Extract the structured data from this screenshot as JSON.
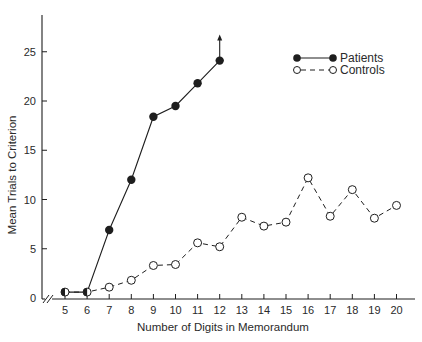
{
  "chart_data": {
    "type": "line",
    "title": "",
    "xlabel": "Number of Digits in Memorandum",
    "ylabel": "Mean Trials to Criterion",
    "x_ticks": [
      5,
      6,
      7,
      8,
      9,
      10,
      11,
      12,
      13,
      14,
      15,
      16,
      17,
      18,
      19,
      20
    ],
    "y_ticks": [
      0,
      5,
      10,
      15,
      20,
      25
    ],
    "ylim": [
      0,
      28
    ],
    "xlim": [
      4,
      20.8
    ],
    "axis_break": "x-axis broken between 0 and 5",
    "grid": false,
    "legend_position": "top-right",
    "series": [
      {
        "name": "Patients",
        "marker": "filled-circle",
        "line_style": "solid",
        "x": [
          5,
          6,
          7,
          8,
          9,
          10,
          11,
          12
        ],
        "y": [
          0.6,
          0.6,
          6.9,
          12.0,
          18.4,
          19.5,
          21.8,
          24.1
        ],
        "annotation": "upward arrow at x=12 (exceeds criterion)"
      },
      {
        "name": "Controls",
        "marker": "open-circle",
        "line_style": "dashed",
        "x": [
          5,
          6,
          7,
          8,
          9,
          10,
          11,
          12,
          13,
          14,
          15,
          16,
          17,
          18,
          19,
          20
        ],
        "y": [
          0.6,
          0.6,
          1.1,
          1.8,
          3.3,
          3.4,
          5.6,
          5.2,
          8.2,
          7.3,
          7.7,
          12.2,
          8.3,
          11.0,
          8.1,
          9.4
        ]
      }
    ],
    "colors": {
      "ink": "#1e1e1e",
      "background": "#ffffff"
    }
  }
}
